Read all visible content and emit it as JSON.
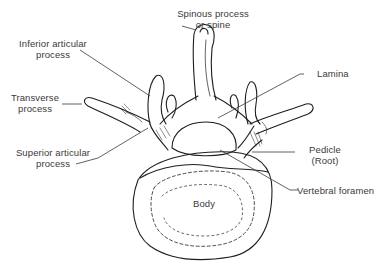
{
  "figure": {
    "line_color": "#1e1e1e",
    "text_color": "#3a3a3a",
    "background": "#ffffff"
  },
  "labels": {
    "spinous": {
      "line1": "Spinous process",
      "line2": "or spine"
    },
    "inferior_articular": {
      "line1": "Inferior articular",
      "line2": "process"
    },
    "transverse": {
      "line1": "Transverse",
      "line2": "process"
    },
    "lamina": {
      "line1": "Lamina"
    },
    "superior_articular": {
      "line1": "Superior articular",
      "line2": "process"
    },
    "pedicle": {
      "line1": "Pedicle",
      "line2": "(Root)"
    },
    "vertebral_foramen": {
      "line1": "Vertebral foramen"
    },
    "body": {
      "line1": "Body"
    }
  }
}
